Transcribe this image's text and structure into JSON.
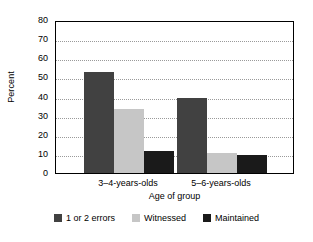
{
  "chart_data": {
    "type": "bar",
    "title": "",
    "xlabel": "Age of group",
    "ylabel": "Percent",
    "categories": [
      "3–4-years-olds",
      "5–6-years-olds"
    ],
    "series": [
      {
        "name": "1 or 2 errors",
        "values": [
          53,
          39
        ],
        "color": "#414141"
      },
      {
        "name": "Witnessed",
        "values": [
          33.5,
          10.5
        ],
        "color": "#c6c6c6"
      },
      {
        "name": "Maintained",
        "values": [
          11.5,
          9.5
        ],
        "color": "#1a1a1a"
      }
    ],
    "ylim": [
      0,
      80
    ],
    "yticks": [
      0,
      10,
      20,
      30,
      40,
      50,
      60,
      70,
      80
    ],
    "ytick_labels": [
      "0",
      "10",
      "20",
      "30",
      "40",
      "50",
      "60",
      "70",
      "80"
    ],
    "grid": true,
    "grid_axis": "y",
    "grid_style": "dotted",
    "legend_position": "bottom",
    "plot_background": "#ffffff",
    "axis_color": "#000000",
    "grid_color": "#9a9a9a"
  }
}
